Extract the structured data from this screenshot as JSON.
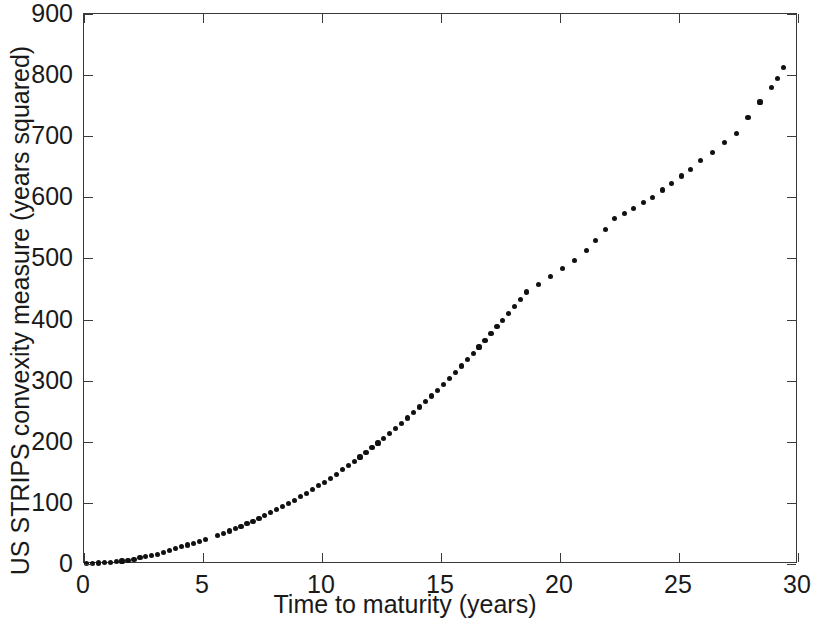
{
  "chart_data": {
    "type": "scatter",
    "title": "",
    "xlabel": "Time to maturity (years)",
    "ylabel": "US STRIPS convexity measure (years squared)",
    "xlim": [
      0,
      30
    ],
    "ylim": [
      0,
      900
    ],
    "xticks": [
      0,
      5,
      10,
      15,
      20,
      25,
      30
    ],
    "yticks": [
      0,
      100,
      200,
      300,
      400,
      500,
      600,
      700,
      800,
      900
    ],
    "xtick_labels": [
      "0",
      "5",
      "10",
      "15",
      "20",
      "25",
      "30"
    ],
    "ytick_labels": [
      "0",
      "100",
      "200",
      "300",
      "400",
      "500",
      "600",
      "700",
      "800",
      "900"
    ],
    "grid": false,
    "legend": null,
    "marker": "filled-circle",
    "marker_color": "#111111",
    "marker_size": 5,
    "series": [
      {
        "name": "US STRIPS convexity",
        "x": [
          0.1,
          0.35,
          0.6,
          0.85,
          1.1,
          1.35,
          1.6,
          1.85,
          2.1,
          2.35,
          2.6,
          2.85,
          3.1,
          3.35,
          3.6,
          3.85,
          4.1,
          4.35,
          4.6,
          4.85,
          5.1,
          5.6,
          5.85,
          6.1,
          6.35,
          6.6,
          6.85,
          7.1,
          7.35,
          7.6,
          7.85,
          8.1,
          8.35,
          8.6,
          8.85,
          9.1,
          9.35,
          9.6,
          9.85,
          10.1,
          10.35,
          10.6,
          10.85,
          11.1,
          11.35,
          11.6,
          11.85,
          12.1,
          12.35,
          12.6,
          12.85,
          13.1,
          13.35,
          13.6,
          13.85,
          14.1,
          14.35,
          14.6,
          14.85,
          15.1,
          15.35,
          15.6,
          15.85,
          16.1,
          16.35,
          16.6,
          16.85,
          17.1,
          17.35,
          17.6,
          17.85,
          18.1,
          18.35,
          18.6,
          19.1,
          19.6,
          20.1,
          20.6,
          21.1,
          21.5,
          21.9,
          22.3,
          22.7,
          23.1,
          23.5,
          23.9,
          24.3,
          24.7,
          25.1,
          25.5,
          25.9,
          26.4,
          26.9,
          27.4,
          27.9,
          28.4,
          28.9,
          29.15,
          29.4
        ],
        "y": [
          0.5,
          1,
          1.5,
          2,
          3,
          4,
          5,
          6,
          8,
          10,
          12,
          14,
          16,
          19,
          22,
          25,
          28,
          31,
          34,
          37,
          40,
          47,
          50,
          54,
          58,
          62,
          66,
          70,
          74,
          79,
          84,
          89,
          94,
          99,
          104,
          110,
          116,
          122,
          128,
          134,
          140,
          147,
          154,
          161,
          168,
          175,
          182,
          190,
          198,
          206,
          214,
          222,
          230,
          239,
          248,
          257,
          266,
          275,
          284,
          294,
          304,
          314,
          324,
          334,
          344,
          355,
          366,
          377,
          388,
          399,
          410,
          421,
          433,
          445,
          457,
          470,
          483,
          497,
          513,
          530,
          548,
          566,
          573,
          582,
          592,
          600,
          612,
          623,
          635,
          645,
          660,
          673,
          690,
          705,
          730,
          756,
          780,
          795,
          812
        ]
      }
    ]
  },
  "axes": {
    "x_title": "Time to maturity (years)",
    "y_title": "US STRIPS convexity measure (years squared)"
  },
  "colors": {
    "marker": "#111111",
    "axis": "#3a3a3a",
    "text": "#1a1a1a",
    "background": "#ffffff"
  }
}
